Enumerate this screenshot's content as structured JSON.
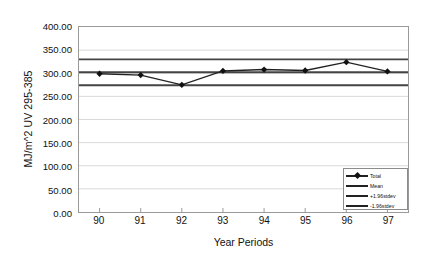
{
  "chart_data": {
    "type": "line",
    "title": "",
    "xlabel": "Year Periods",
    "ylabel": "MJ/m^2 UV 295-385",
    "categories": [
      "90",
      "91",
      "92",
      "93",
      "94",
      "95",
      "96",
      "97"
    ],
    "xlim": [
      null,
      null
    ],
    "ylim": [
      0,
      400
    ],
    "yticks": [
      "0.00",
      "50.00",
      "100.00",
      "150.00",
      "200.00",
      "250.00",
      "300.00",
      "350.00",
      "400.00"
    ],
    "ytick_values": [
      0,
      50,
      100,
      150,
      200,
      250,
      300,
      350,
      400
    ],
    "grid": "horizontal",
    "legend_position": "bottom-right",
    "series": [
      {
        "name": "Total",
        "marker": "diamond",
        "values": [
          299,
          296,
          275,
          305,
          308,
          306,
          324,
          304
        ]
      },
      {
        "name": "Mean",
        "marker": "none",
        "constant": 302
      },
      {
        "name": "+1.96stdev",
        "marker": "none",
        "constant": 330
      },
      {
        "name": "-1.96stdev",
        "marker": "none",
        "constant": 274
      }
    ]
  },
  "axes": {
    "y_title": "MJ/m^2 UV 295-385",
    "x_title": "Year Periods"
  },
  "legend": {
    "items": [
      {
        "label": "Total"
      },
      {
        "label": "Mean"
      },
      {
        "label": "+1.96stdev"
      },
      {
        "label": "-1.96stdev"
      }
    ]
  },
  "colors": {
    "series_line": "#222222",
    "band_line": "#444444",
    "grid": "#d9d9d9",
    "frame": "#9a9a9a",
    "text": "#111111",
    "background": "#ffffff"
  }
}
